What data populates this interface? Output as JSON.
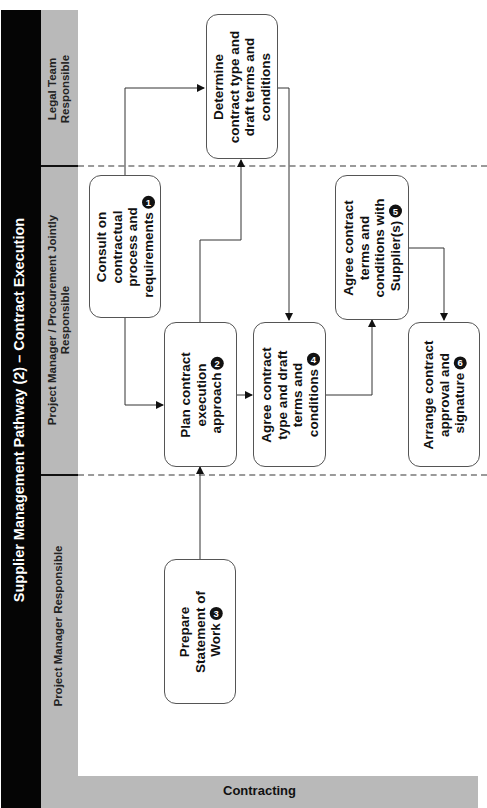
{
  "diagram": {
    "title": "Supplier Management Pathway (2) – Contract Execution",
    "stage_label": "Contracting",
    "lanes": [
      {
        "id": "legal",
        "label_line1": "Legal Team",
        "label_line2": "Responsible"
      },
      {
        "id": "joint",
        "label_line1": "Project Manager / Procurement Jointly",
        "label_line2": "Responsible"
      },
      {
        "id": "pm",
        "label_line1": "Project Manager Responsible",
        "label_line2": ""
      }
    ],
    "steps": [
      {
        "id": "determine",
        "lane": "legal",
        "lines": [
          "Determine",
          "contract type and",
          "draft terms and",
          "conditions"
        ],
        "number": ""
      },
      {
        "id": "step1",
        "lane": "joint",
        "lines": [
          "Consult on",
          "contractual",
          "process and",
          "requirements"
        ],
        "number": "1"
      },
      {
        "id": "step2",
        "lane": "joint",
        "lines": [
          "Plan contract",
          "execution",
          "approach"
        ],
        "number": "2"
      },
      {
        "id": "step3",
        "lane": "pm",
        "lines": [
          "Prepare",
          "Statement of",
          "Work"
        ],
        "number": "3"
      },
      {
        "id": "step4",
        "lane": "joint",
        "lines": [
          "Agree contract",
          "type and draft",
          "terms and",
          "conditions"
        ],
        "number": "4"
      },
      {
        "id": "step5",
        "lane": "joint",
        "lines": [
          "Agree contract",
          "terms and",
          "conditions with",
          "Supplier(s)"
        ],
        "number": "5"
      },
      {
        "id": "step6",
        "lane": "joint",
        "lines": [
          "Arrange contract",
          "approval and",
          "signature"
        ],
        "number": "6"
      }
    ],
    "connections": [
      {
        "from": "step1",
        "to": "determine"
      },
      {
        "from": "step1",
        "to": "step2"
      },
      {
        "from": "step3",
        "to": "step2"
      },
      {
        "from": "step2",
        "to": "determine"
      },
      {
        "from": "determine",
        "to": "step4"
      },
      {
        "from": "step2",
        "to": "step4"
      },
      {
        "from": "step4",
        "to": "step5"
      },
      {
        "from": "step5",
        "to": "step6"
      }
    ],
    "colors": {
      "title_bar": "#050505",
      "lane_header": "#b9b9b9",
      "divider_dash": "#9a9a9a",
      "box_border": "#555555",
      "badge": "#111111"
    }
  }
}
